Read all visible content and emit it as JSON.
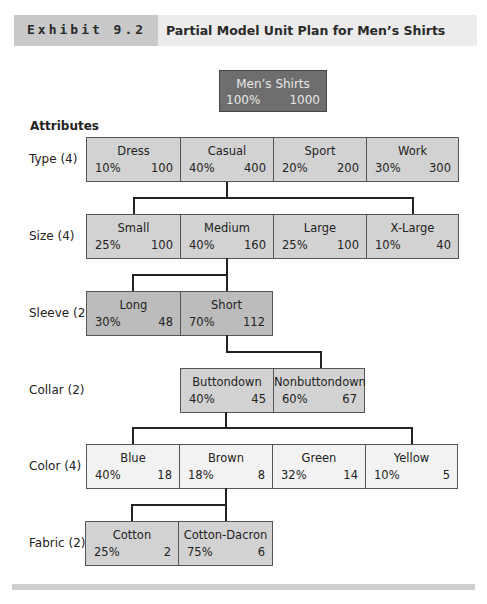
{
  "header": {
    "exhibit": "Exhibit 9.2",
    "title": "Partial Model Unit Plan for Men’s Shirts"
  },
  "root": {
    "name": "Men’s Shirts",
    "pct": "100%",
    "count": "1000"
  },
  "attributes_title": "Attributes",
  "rows": [
    {
      "label": "Type (4)",
      "cells": [
        {
          "name": "Dress",
          "pct": "10%",
          "count": "100"
        },
        {
          "name": "Casual",
          "pct": "40%",
          "count": "400"
        },
        {
          "name": "Sport",
          "pct": "20%",
          "count": "200"
        },
        {
          "name": "Work",
          "pct": "30%",
          "count": "300"
        }
      ]
    },
    {
      "label": "Size (4)",
      "cells": [
        {
          "name": "Small",
          "pct": "25%",
          "count": "100"
        },
        {
          "name": "Medium",
          "pct": "40%",
          "count": "160"
        },
        {
          "name": "Large",
          "pct": "25%",
          "count": "100"
        },
        {
          "name": "X-Large",
          "pct": "10%",
          "count": "40"
        }
      ]
    },
    {
      "label": "Sleeve (2)",
      "cells": [
        {
          "name": "Long",
          "pct": "30%",
          "count": "48"
        },
        {
          "name": "Short",
          "pct": "70%",
          "count": "112"
        }
      ]
    },
    {
      "label": "Collar (2)",
      "cells": [
        {
          "name": "Buttondown",
          "pct": "40%",
          "count": "45"
        },
        {
          "name": "Nonbuttondown",
          "pct": "60%",
          "count": "67"
        }
      ]
    },
    {
      "label": "Color (4)",
      "cells": [
        {
          "name": "Blue",
          "pct": "40%",
          "count": "18"
        },
        {
          "name": "Brown",
          "pct": "18%",
          "count": "8"
        },
        {
          "name": "Green",
          "pct": "32%",
          "count": "14"
        },
        {
          "name": "Yellow",
          "pct": "10%",
          "count": "5"
        }
      ]
    },
    {
      "label": "Fabric (2)",
      "cells": [
        {
          "name": "Cotton",
          "pct": "25%",
          "count": "2"
        },
        {
          "name": "Cotton-Dacron",
          "pct": "75%",
          "count": "6"
        }
      ]
    }
  ],
  "colors": {
    "root_fill": "#6e6e6e",
    "dark_fill": "#bcbcbc",
    "mid_fill": "#d2d2d2",
    "light_fill": "#f2f2f2"
  }
}
